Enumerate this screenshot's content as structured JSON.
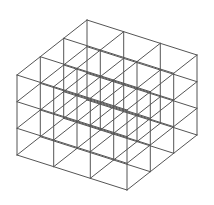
{
  "diagram": {
    "title": "3x3x3 cube lattice wireframe",
    "type": "wireframe-cube-grid",
    "divisions": {
      "left": 3,
      "right": 3,
      "vertical": 3
    },
    "projection": {
      "front_top_vertex": [
        127,
        110
      ],
      "left_edge_vector": [
        -110,
        -35
      ],
      "right_edge_vector": [
        70,
        -55
      ],
      "height_vector": [
        0,
        80
      ]
    },
    "style": {
      "background": "#ffffff",
      "line_color": "#555555",
      "line_width": 1
    }
  }
}
